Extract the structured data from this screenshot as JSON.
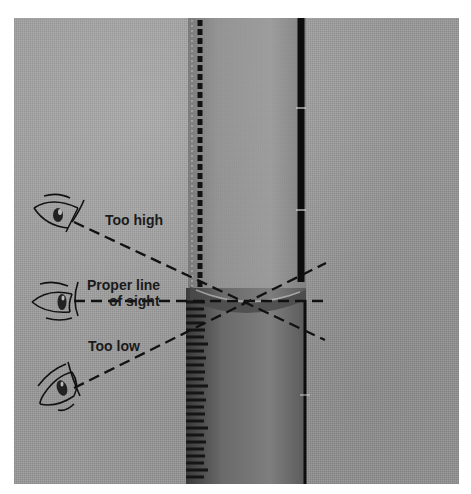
{
  "figure": {
    "labels": {
      "too_high": "Too high",
      "proper_line_1": "Proper line",
      "proper_line_2": "of sight",
      "too_low": "Too low"
    },
    "eyes": [
      {
        "id": "eye-high",
        "position": "Too high"
      },
      {
        "id": "eye-proper",
        "position": "Proper line of sight"
      },
      {
        "id": "eye-low",
        "position": "Too low"
      }
    ],
    "colors": {
      "background": "#9a9a9a",
      "line": "#111111",
      "page": "#ffffff"
    }
  }
}
